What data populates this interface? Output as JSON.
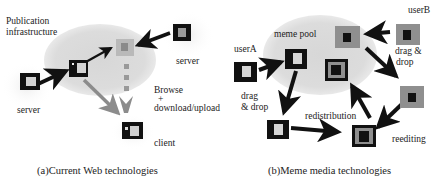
{
  "panel_a": {
    "caption": "(a)Current Web technologies",
    "labels": {
      "pool": "Publication\ninfrastructure",
      "pool_line1": "Publication",
      "pool_line2": "infrastructure",
      "server_left": "server",
      "server_right": "server",
      "browse_line1": "Browse",
      "browse_line2": "+",
      "browse_line3": "download/upload",
      "client": "client"
    },
    "nodes": [
      {
        "id": "server-left",
        "label": "server",
        "style": "black-frame-light-inner"
      },
      {
        "id": "pool-doc",
        "style": "black-frame-light-inner"
      },
      {
        "id": "published-doc",
        "style": "gray-frame-gray-inner"
      },
      {
        "id": "server-right",
        "label": "server",
        "style": "black-frame-gray-inner"
      },
      {
        "id": "client",
        "label": "client",
        "style": "black-frame-two-inner"
      }
    ],
    "edges": [
      {
        "from": "server-left",
        "to": "pool-doc",
        "style": "black-arrow"
      },
      {
        "from": "pool-doc",
        "to": "published-doc",
        "style": "black-arrow"
      },
      {
        "from": "server-right",
        "to": "published-doc",
        "style": "black-arrow"
      },
      {
        "from": "pool-doc",
        "to": "client",
        "style": "gray-arrow"
      },
      {
        "from": "published-doc",
        "to": "client",
        "style": "gray-dashed-arrow"
      }
    ]
  },
  "panel_b": {
    "caption": "(b)Meme media technologies",
    "labels": {
      "pool": "meme pool",
      "userA": "userA",
      "userB": "userB",
      "dragdrop_left_1": "drag",
      "dragdrop_left_2": "& drop",
      "dragdrop_right_1": "drag &",
      "dragdrop_right_2": "drop",
      "redistribution": "redistribution",
      "reediting": "reediting"
    },
    "nodes": [
      {
        "id": "userA-doc",
        "label": "userA",
        "style": "black-frame-light-inner"
      },
      {
        "id": "pool-docA",
        "style": "black-frame-light-inner"
      },
      {
        "id": "pool-docB",
        "style": "gray-frame-black-inner"
      },
      {
        "id": "pool-doc-composite",
        "style": "black-gray-black-nested"
      },
      {
        "id": "userB-doc",
        "label": "userB",
        "style": "gray-frame-black-inner"
      },
      {
        "id": "reedit-doc",
        "style": "gray-frame-black-inner"
      },
      {
        "id": "userA-local",
        "style": "black-frame-light-inner"
      },
      {
        "id": "composite",
        "style": "black-gray-black-nested"
      }
    ],
    "edges": [
      {
        "from": "userA-doc",
        "to": "pool-docA",
        "label": "drag & drop"
      },
      {
        "from": "userB-doc",
        "to": "pool-docB",
        "label": "drag & drop"
      },
      {
        "from": "pool-docA",
        "to": "userA-local"
      },
      {
        "from": "pool-docB",
        "to": "reedit-doc"
      },
      {
        "from": "userA-local",
        "to": "composite"
      },
      {
        "from": "reedit-doc",
        "to": "composite",
        "label": "reediting"
      },
      {
        "from": "composite",
        "to": "pool-doc-composite",
        "label": "redistribution"
      }
    ]
  },
  "colors": {
    "pool": "#d9d9d9",
    "black": "#111111",
    "gray_frame": "#8a8a8a",
    "light_inner": "#d6d6d6",
    "gray_arrow": "#8c8c8c"
  }
}
